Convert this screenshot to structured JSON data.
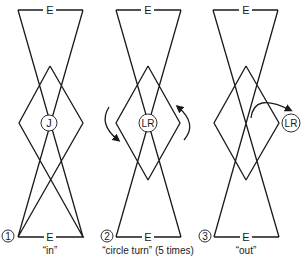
{
  "panels": [
    {
      "number": "1",
      "top_label": "E",
      "bottom_label": "E",
      "center_label": "J",
      "caption": "“in”"
    },
    {
      "number": "2",
      "top_label": "E",
      "bottom_label": "E",
      "center_label": "LR",
      "caption": "“circle turn” (5 times)"
    },
    {
      "number": "3",
      "top_label": "E",
      "bottom_label": "E",
      "center_label": "LR",
      "caption": "“out”"
    }
  ],
  "colors": {
    "stroke": "#1a1a1a",
    "background": "#ffffff"
  }
}
